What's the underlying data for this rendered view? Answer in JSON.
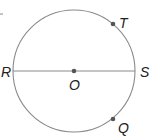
{
  "diagram": {
    "type": "circle-geometry",
    "colors": {
      "stroke": "#8a8a8a",
      "point": "#555555",
      "label": "#222222"
    },
    "circle": {
      "center_label": "O",
      "cx": 74,
      "cy": 71,
      "r": 61
    },
    "diameter": {
      "endpoints": [
        "R",
        "S"
      ]
    },
    "points": [
      {
        "id": "T",
        "label": "T",
        "x": 113,
        "y": 24,
        "label_x": 119,
        "label_y": 28
      },
      {
        "id": "O",
        "label": "O",
        "x": 74,
        "y": 71,
        "label_x": 69,
        "label_y": 90
      },
      {
        "id": "Q",
        "label": "Q",
        "x": 113,
        "y": 119,
        "label_x": 118,
        "label_y": 133
      }
    ],
    "endpoint_labels": [
      {
        "id": "R",
        "label": "R",
        "x": 1,
        "y": 77
      },
      {
        "id": "S",
        "label": "S",
        "x": 140,
        "y": 77
      }
    ]
  }
}
